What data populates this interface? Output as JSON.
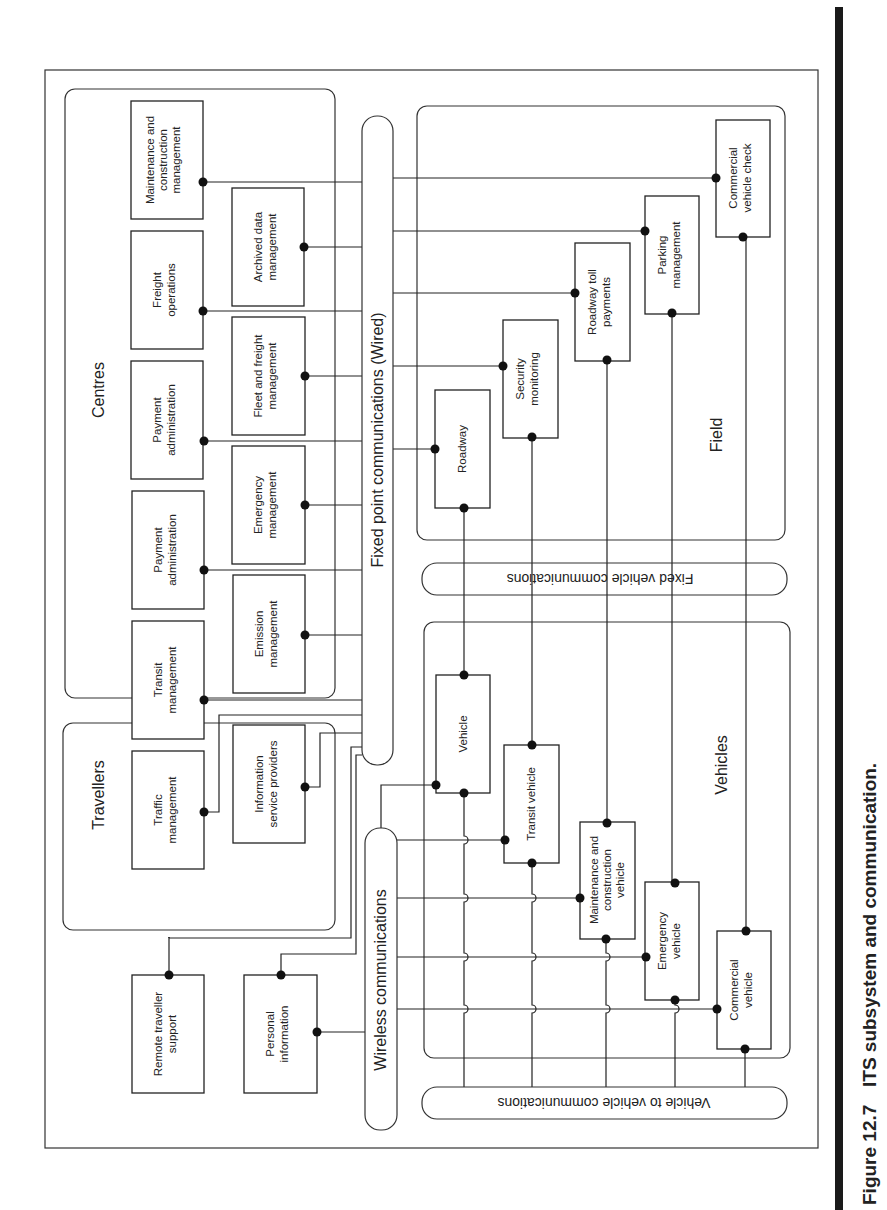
{
  "caption": {
    "figure_number": "Figure 12.7",
    "title": "ITS subsystem and communication."
  },
  "groups": {
    "centres": "Centres",
    "travellers": "Travellers",
    "field": "Field",
    "vehicles": "Vehicles"
  },
  "buses": {
    "wired": "Fixed point communications (Wired)",
    "wireless": "Wireless communications",
    "fixed_vehicle": "Fixed vehicle communications",
    "v2v": "Vehicle to vehicle communications"
  },
  "centres": {
    "outer": [
      {
        "line1": "Maintenance and",
        "line2": "construction",
        "line3": "management"
      },
      {
        "line1": "Freight",
        "line2": "operations"
      },
      {
        "line1": "Payment",
        "line2": "administration"
      },
      {
        "line1": "Payment",
        "line2": "administration"
      },
      {
        "line1": "Transit",
        "line2": "management"
      },
      {
        "line1": "Traffic",
        "line2": "management"
      }
    ],
    "inner": [
      {
        "line1": "Archived data",
        "line2": "management"
      },
      {
        "line1": "Fleet and freight",
        "line2": "management"
      },
      {
        "line1": "Emergency",
        "line2": "management"
      },
      {
        "line1": "Emission",
        "line2": "management"
      },
      {
        "line1": "Information",
        "line2": "service providers"
      }
    ]
  },
  "travellers": [
    {
      "line1": "Remote traveller",
      "line2": "support"
    },
    {
      "line1": "Personal",
      "line2": "information"
    }
  ],
  "field": [
    {
      "line1": "Commercial",
      "line2": "vehicle check"
    },
    {
      "line1": "Parking",
      "line2": "management"
    },
    {
      "line1": "Roadway toll",
      "line2": "payments"
    },
    {
      "line1": "Security",
      "line2": "monitoring"
    },
    {
      "line1": "Roadway"
    }
  ],
  "vehicles": [
    {
      "line1": "Vehicle"
    },
    {
      "line1": "Transit vehicle"
    },
    {
      "line1": "Maintenance and",
      "line2": "construction",
      "line3": "vehicle"
    },
    {
      "line1": "Emergency",
      "line2": "vehicle"
    },
    {
      "line1": "Commercial",
      "line2": "vehicle"
    }
  ]
}
